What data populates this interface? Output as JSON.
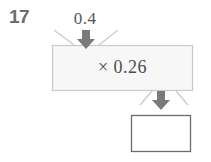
{
  "worksheet": {
    "problem_number": "17",
    "input_value": "0.4",
    "operation_label": "× 0.26",
    "answer_value": "",
    "answer_placeholder": ""
  },
  "icons": {
    "input_arrow": "arrow-down-icon",
    "output_arrow": "arrow-down-icon"
  },
  "colors": {
    "problem_number": "#6d6d6d",
    "text": "#4c4c4c",
    "box_fill": "#f7f7f7",
    "box_stroke": "#c8c8c8",
    "arrow_fill": "#7a7a7a",
    "answer_box_fill": "#ffffff",
    "answer_box_stroke": "#6b6b6b",
    "funnel_stroke": "#cccccc",
    "background": "#ffffff"
  }
}
